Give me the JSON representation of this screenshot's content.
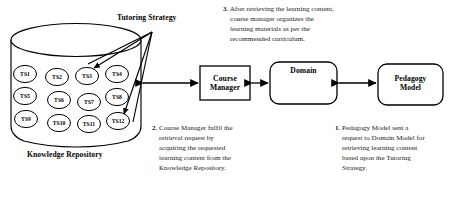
{
  "figure": {
    "labels": {
      "tutoring_strategy": "Tutoring Strategy",
      "knowledge_repository": "Knowledge Repository"
    },
    "nodes": [
      {
        "id": "course-manager",
        "line1": "Course",
        "line2": "Manager"
      },
      {
        "id": "domain",
        "line1": "Domain",
        "line2": ""
      },
      {
        "id": "pedagogy-model",
        "line1": "Pedagogy",
        "line2": "Model"
      }
    ],
    "tutoring_strategies": [
      {
        "label": "TS1",
        "cx": 25,
        "cy": 74
      },
      {
        "label": "TS2",
        "cx": 57,
        "cy": 77
      },
      {
        "label": "TS3",
        "cx": 87,
        "cy": 76
      },
      {
        "label": "TS4",
        "cx": 117,
        "cy": 74
      },
      {
        "label": "TS5",
        "cx": 25,
        "cy": 96
      },
      {
        "label": "TS6",
        "cx": 59,
        "cy": 100
      },
      {
        "label": "TS7",
        "cx": 89,
        "cy": 102
      },
      {
        "label": "TS8",
        "cx": 117,
        "cy": 97
      },
      {
        "label": "TS9",
        "cx": 26,
        "cy": 119
      },
      {
        "label": "TS10",
        "cx": 59,
        "cy": 123
      },
      {
        "label": "TS11",
        "cx": 89,
        "cy": 124
      },
      {
        "label": "TS12",
        "cx": 118,
        "cy": 121
      }
    ],
    "notes": [
      {
        "id": "note-3",
        "number": "3",
        "text": ". After retrieving the learning content, course manager organizes the learning materials as per the recommended curriculum."
      },
      {
        "id": "note-2",
        "number": "2",
        "text": ". Course Manager fulfil the retrieval request by acquiring the requested learning content from the Knowledge Repository."
      },
      {
        "id": "note-1",
        "number": "1",
        "text": ". Pedagogy Model sent a request to Domain Model for retrieving learning content based upon the Tutoring Strategy."
      }
    ],
    "colors": {
      "stroke": "#000000",
      "text": "#000000",
      "background": "#ffffff"
    }
  }
}
